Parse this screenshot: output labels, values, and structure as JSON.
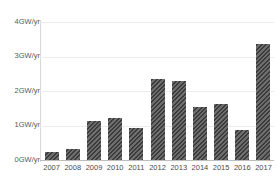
{
  "chart_data": {
    "type": "bar",
    "title": "",
    "xlabel": "",
    "ylabel": "",
    "categories": [
      "2007",
      "2008",
      "2009",
      "2010",
      "2011",
      "2012",
      "2013",
      "2014",
      "2015",
      "2016",
      "2017"
    ],
    "values": [
      0.23,
      0.32,
      1.14,
      1.23,
      0.93,
      2.34,
      2.28,
      1.55,
      1.63,
      0.87,
      3.35
    ],
    "ylim": [
      0,
      4
    ],
    "ytick_values": [
      0,
      1,
      2,
      3,
      4
    ],
    "ytick_labels": [
      "0GW/yr",
      "1GW/yr",
      "2GW/yr",
      "3GW/yr",
      "4GW/yr"
    ],
    "grid": true,
    "legend": null,
    "legend_position": "none",
    "series": [
      {
        "name": "Annual capacity additions",
        "values": [
          0.23,
          0.32,
          1.14,
          1.23,
          0.93,
          2.34,
          2.28,
          1.55,
          1.63,
          0.87,
          3.35
        ]
      }
    ]
  },
  "style": {
    "bar_color": "#3b3b3b",
    "grid_color": "#ececec",
    "axis_color": "#bdbdbd",
    "tick_text_color": "#4a4a4a",
    "background": "#ffffff"
  },
  "top_strip": {
    "ghost_text": "· · ·   · ·    ·"
  }
}
